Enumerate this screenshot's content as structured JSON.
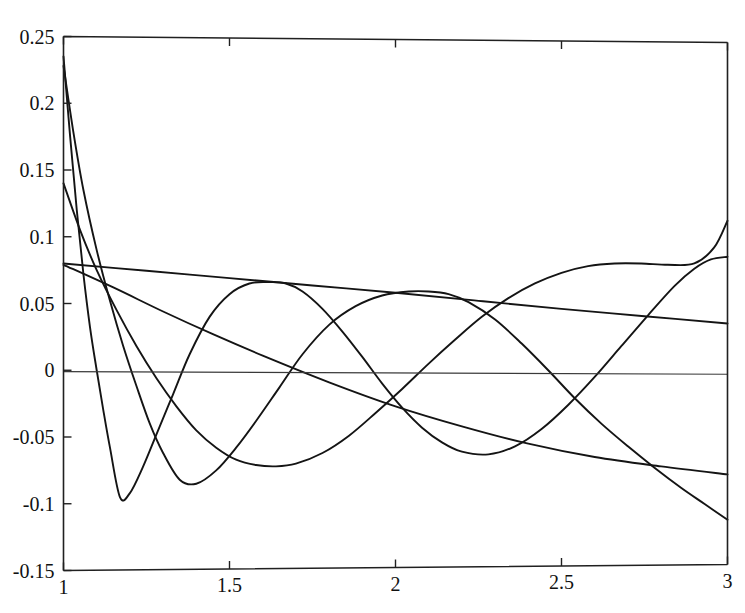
{
  "figure": {
    "title_fragment": "",
    "background_color": "#ffffff",
    "line_color": "#141414",
    "axis_color": "#202020"
  },
  "axes": {
    "x_ticks": [
      "1",
      "1.5",
      "2",
      "2.5",
      "3"
    ],
    "y_ticks": [
      "0.25",
      "0.2",
      "0.15",
      "0.1",
      "0.05",
      "0",
      "-0.05",
      "-0.1",
      "-0.15"
    ]
  },
  "chart_data": {
    "type": "line",
    "title": "",
    "xlabel": "",
    "ylabel": "",
    "xlim": [
      1,
      3
    ],
    "ylim": [
      -0.15,
      0.25
    ],
    "xticks": [
      1,
      1.5,
      2,
      2.5,
      3
    ],
    "yticks": [
      0.25,
      0.2,
      0.15,
      0.1,
      0.05,
      0,
      -0.05,
      -0.1,
      -0.15
    ],
    "grid": false,
    "legend": "none",
    "annotations": [
      {
        "text": "zero reference line at y = 0",
        "y": 0
      },
      {
        "text": "all curves begin at x = 1 with steep descent"
      },
      {
        "text": "oscillations damp toward the right"
      }
    ],
    "series": [
      {
        "name": "curve-1",
        "comment": "steepest start 0.235, deepest first trough near x=1.17",
        "x": [
          1.0,
          1.02,
          1.04,
          1.06,
          1.08,
          1.1,
          1.12,
          1.14,
          1.17,
          1.2,
          1.24,
          1.28,
          1.33,
          1.38,
          1.44,
          1.5,
          1.56,
          1.62,
          1.67,
          1.72,
          1.78,
          1.84,
          1.9,
          1.96,
          2.02,
          2.08,
          2.14,
          2.2,
          2.28,
          2.36,
          2.44,
          2.52,
          2.6,
          2.68,
          2.76,
          2.84,
          2.9,
          2.95,
          3.0
        ],
        "y": [
          0.235,
          0.175,
          0.12,
          0.072,
          0.032,
          0.0,
          -0.03,
          -0.058,
          -0.095,
          -0.092,
          -0.072,
          -0.048,
          -0.018,
          0.012,
          0.04,
          0.057,
          0.065,
          0.066,
          0.065,
          0.059,
          0.046,
          0.029,
          0.01,
          -0.01,
          -0.028,
          -0.043,
          -0.054,
          -0.061,
          -0.063,
          -0.057,
          -0.044,
          -0.026,
          -0.005,
          0.018,
          0.041,
          0.063,
          0.076,
          0.083,
          0.085
        ]
      },
      {
        "name": "curve-2",
        "comment": "start 0.228, trough near x=1.30 at -0.085, peak near x=2.15",
        "x": [
          1.0,
          1.03,
          1.06,
          1.1,
          1.14,
          1.18,
          1.22,
          1.26,
          1.3,
          1.35,
          1.4,
          1.46,
          1.52,
          1.58,
          1.65,
          1.72,
          1.8,
          1.88,
          1.96,
          2.04,
          2.1,
          2.16,
          2.22,
          2.3,
          2.38,
          2.46,
          2.54,
          2.62,
          2.7,
          2.78,
          2.86,
          2.93,
          3.0
        ],
        "y": [
          0.228,
          0.178,
          0.135,
          0.09,
          0.052,
          0.018,
          -0.012,
          -0.04,
          -0.062,
          -0.082,
          -0.085,
          -0.075,
          -0.058,
          -0.038,
          -0.013,
          0.012,
          0.034,
          0.048,
          0.056,
          0.059,
          0.059,
          0.057,
          0.051,
          0.038,
          0.02,
          0.0,
          -0.021,
          -0.04,
          -0.057,
          -0.073,
          -0.088,
          -0.1,
          -0.112
        ]
      },
      {
        "name": "curve-3",
        "comment": "start 0.14, shallower descent, broad trough near x=1.62",
        "x": [
          1.0,
          1.05,
          1.1,
          1.16,
          1.22,
          1.28,
          1.34,
          1.4,
          1.46,
          1.52,
          1.58,
          1.64,
          1.7,
          1.78,
          1.86,
          1.94,
          2.02,
          2.1,
          2.18,
          2.26,
          2.34,
          2.42,
          2.5,
          2.58,
          2.66,
          2.74,
          2.82,
          2.9,
          2.96,
          3.0
        ],
        "y": [
          0.14,
          0.105,
          0.075,
          0.045,
          0.018,
          -0.006,
          -0.027,
          -0.045,
          -0.058,
          -0.067,
          -0.071,
          -0.072,
          -0.07,
          -0.062,
          -0.049,
          -0.032,
          -0.014,
          0.005,
          0.023,
          0.04,
          0.054,
          0.065,
          0.073,
          0.078,
          0.08,
          0.08,
          0.079,
          0.08,
          0.092,
          0.112
        ]
      },
      {
        "name": "curve-4",
        "comment": "near-linear slow decline from 0.08 to 0.035",
        "x": [
          1.0,
          1.25,
          1.5,
          1.75,
          2.0,
          2.25,
          2.5,
          2.75,
          3.0
        ],
        "y": [
          0.08,
          0.0745,
          0.069,
          0.0635,
          0.058,
          0.052,
          0.046,
          0.0405,
          0.035
        ]
      },
      {
        "name": "curve-5",
        "comment": "near-linear decline from 0.08 crossing zero near x=1.35 down to -0.078",
        "x": [
          1.0,
          1.15,
          1.3,
          1.45,
          1.6,
          1.8,
          2.0,
          2.2,
          2.4,
          2.6,
          2.8,
          3.0
        ],
        "y": [
          0.079,
          0.062,
          0.044,
          0.027,
          0.011,
          -0.009,
          -0.027,
          -0.042,
          -0.055,
          -0.065,
          -0.072,
          -0.078
        ]
      },
      {
        "name": "zero-line",
        "comment": "horizontal reference at y=0 spanning full x range",
        "x": [
          1.0,
          3.0
        ],
        "y": [
          -0.001,
          -0.003
        ]
      }
    ]
  }
}
